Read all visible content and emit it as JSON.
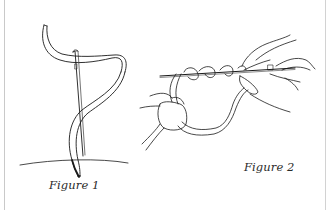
{
  "figure": {
    "panels": [
      {
        "id": "figure-1",
        "caption": "Figure 1",
        "depicts": "needle threaded with ribbon piercing fabric"
      },
      {
        "id": "figure-2",
        "caption": "Figure 2",
        "depicts": "two hands wrapping ribbon around needle"
      }
    ],
    "colors": {
      "line": "#1a1a1a",
      "background": "#ffffff",
      "border": "#c9c9c9"
    }
  }
}
